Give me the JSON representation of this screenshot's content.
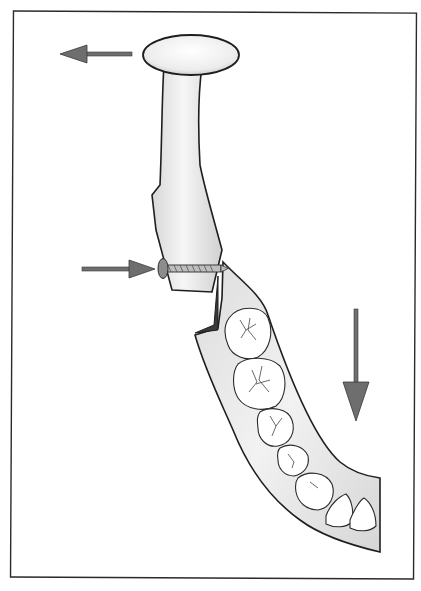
{
  "figure": {
    "type": "anatomical-illustration",
    "frame": {
      "stroke": "#2a2a2a",
      "background": "#ffffff"
    },
    "colors": {
      "arrow_fill": "#6e6e6e",
      "arrow_stroke": "#3a3a3a",
      "bone_fill": "#e6e6e6",
      "bone_highlight": "#fafafa",
      "outline": "#1e1e1e",
      "tooth_fill": "#ffffff"
    },
    "arrows": [
      {
        "id": "condyle-arrow",
        "direction": "left"
      },
      {
        "id": "screw-arrow",
        "direction": "right"
      },
      {
        "id": "body-arrow",
        "direction": "down"
      }
    ],
    "teeth_count": 7,
    "fixation": {
      "type": "screw",
      "count": 1
    }
  }
}
